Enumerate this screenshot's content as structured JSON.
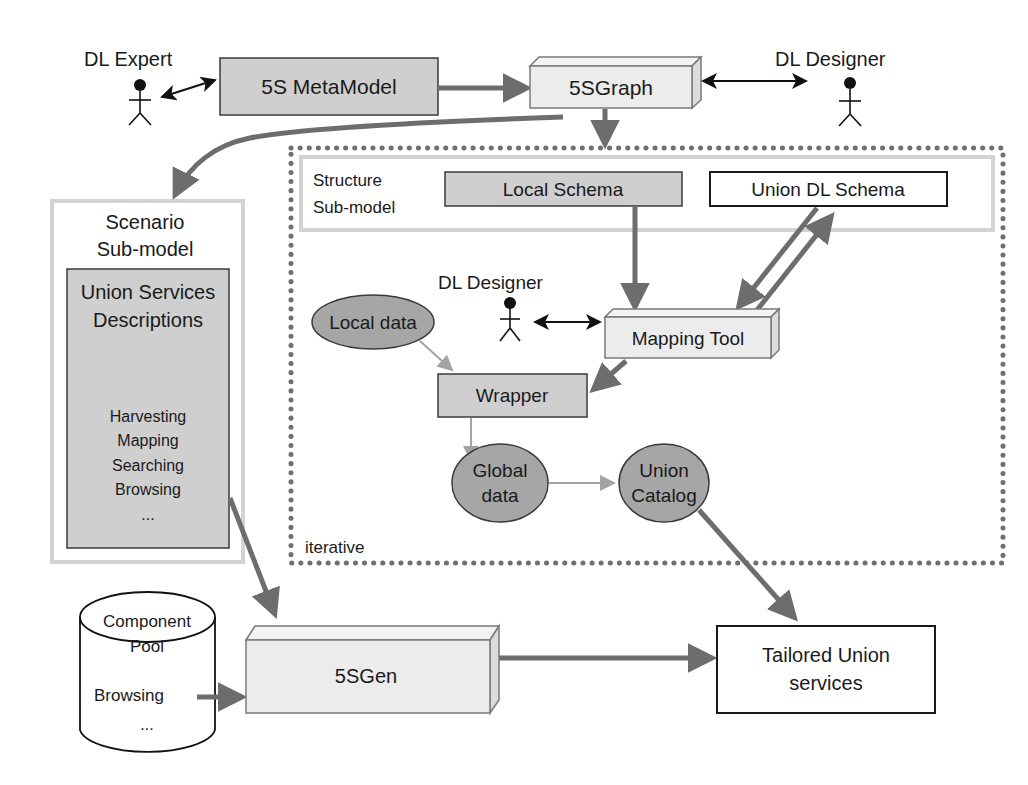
{
  "diagram": {
    "actors": {
      "dl_expert": "DL Expert",
      "dl_designer_top": "DL Designer",
      "dl_designer_inner": "DL Designer"
    },
    "nodes": {
      "metamodel": "5S MetaModel",
      "graph": "5SGraph",
      "structure_submodel": [
        "Structure",
        "Sub-model"
      ],
      "local_schema": "Local Schema",
      "union_dl_schema": "Union DL Schema",
      "scenario_submodel": [
        "Scenario",
        "Sub-model"
      ],
      "union_services_descriptions": [
        "Union Services",
        "Descriptions"
      ],
      "services_list": [
        "Harvesting",
        "Mapping",
        "Searching",
        "Browsing",
        "..."
      ],
      "mapping_tool": "Mapping Tool",
      "local_data": "Local data",
      "wrapper": "Wrapper",
      "global_data": [
        "Global",
        "data"
      ],
      "union_catalog": [
        "Union",
        "Catalog"
      ],
      "iterative_label": "iterative",
      "component_pool": [
        "Component",
        "Pool"
      ],
      "component_pool_items": [
        "Browsing",
        "..."
      ],
      "gen": "5SGen",
      "tailored_services": [
        "Tailored Union",
        "services"
      ]
    },
    "colors": {
      "gray_box": "#cfcfcf",
      "light_3d_box": "#ececec",
      "ellipse_fill": "#a6a6a6",
      "thick_arrow": "#6d6d6d",
      "thin_arrow": "#a3a3a3",
      "dotted_border": "#6f6f6f",
      "band_border": "#d3d3d3"
    }
  }
}
